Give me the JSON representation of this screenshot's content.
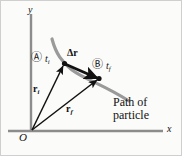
{
  "figure": {
    "axes": {
      "y_label": "y",
      "x_label": "x",
      "origin_label": "O"
    },
    "points": {
      "a_marker": "Ⓐ",
      "a_time_symbol": "t",
      "a_time_subscript": "i",
      "b_marker": "Ⓑ",
      "b_time_symbol": "t",
      "b_time_subscript": "f"
    },
    "vectors": {
      "displacement_symbol": "Δr",
      "initial_symbol": "r",
      "initial_subscript": "i",
      "final_symbol": "r",
      "final_subscript": "f"
    },
    "annotation": {
      "path_line1": "Path of",
      "path_line2": "particle"
    },
    "colors": {
      "background": "#fbfbf9",
      "border": "#cfcfcf",
      "axis": "#8c8c8c",
      "path_curve": "#9a9a9a",
      "vector": "#111111",
      "text": "#111111"
    }
  }
}
